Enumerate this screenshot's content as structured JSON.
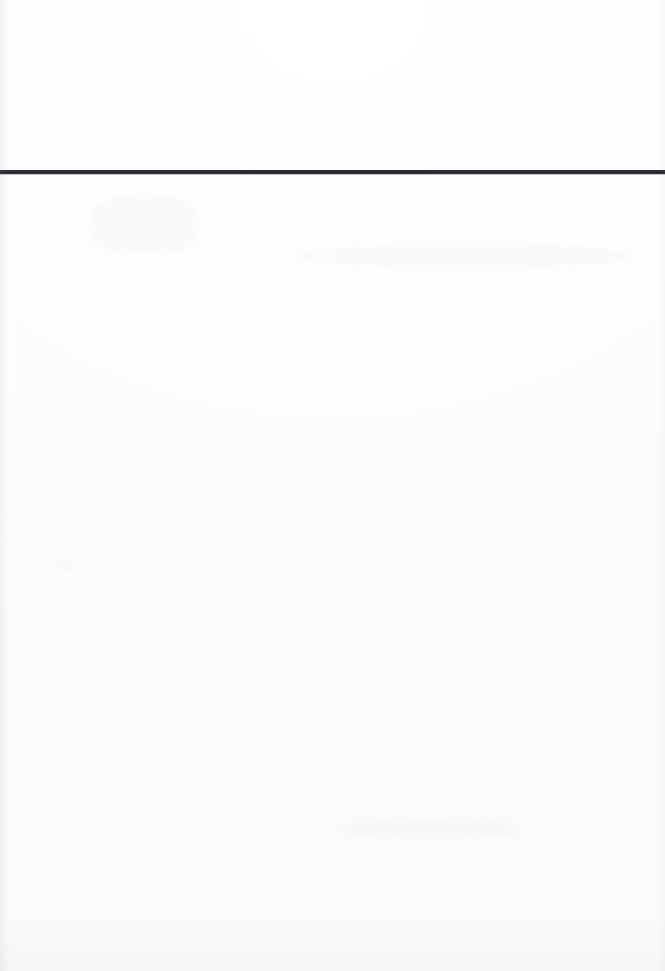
{
  "document": {
    "page_kind": "scanned-blank-page",
    "background_color": "#ffffff",
    "body_text": "",
    "page_number": ""
  },
  "header": {
    "title": "",
    "subtitle": "",
    "rule": {
      "color": "#2b2d31",
      "thickness_px": 4,
      "top_px": 170,
      "width_px": 665
    },
    "graphic": {
      "name": "network-mesh-graphic",
      "description": "abstract low-poly network of nodes connected by thin straight lines, densest toward the upper right",
      "node_color": "#b4b7bd",
      "node_color_dark": "#9a9ea6",
      "edge_color": "#d6d8dc",
      "edge_color_faint": "#e8e9ec",
      "nodes": [
        {
          "id": "n1",
          "x": 4,
          "y": 32,
          "r": 4.2,
          "shade": "dark"
        },
        {
          "id": "n2",
          "x": 74,
          "y": 78,
          "r": 3.6,
          "shade": "dark"
        },
        {
          "id": "n3",
          "x": 154,
          "y": 56,
          "r": 3.8,
          "shade": "mid"
        },
        {
          "id": "n4",
          "x": 152,
          "y": 135,
          "r": 3.2,
          "shade": "light"
        },
        {
          "id": "n5",
          "x": 237,
          "y": 112,
          "r": 3.4,
          "shade": "mid"
        },
        {
          "id": "n6",
          "x": 305,
          "y": 55,
          "r": 3.0,
          "shade": "light"
        },
        {
          "id": "n7",
          "x": 434,
          "y": 37,
          "r": 3.6,
          "shade": "mid"
        },
        {
          "id": "n8",
          "x": 441,
          "y": 64,
          "r": 3.2,
          "shade": "light"
        },
        {
          "id": "n9",
          "x": 497,
          "y": 21,
          "r": 3.4,
          "shade": "mid"
        },
        {
          "id": "n10",
          "x": 521,
          "y": 58,
          "r": 3.6,
          "shade": "mid"
        },
        {
          "id": "n11",
          "x": 531,
          "y": 75,
          "r": 3.6,
          "shade": "mid"
        },
        {
          "id": "n12",
          "x": 530,
          "y": 14,
          "r": 3.0,
          "shade": "light"
        },
        {
          "id": "n13",
          "x": 553,
          "y": 87,
          "r": 3.8,
          "shade": "dark"
        },
        {
          "id": "n14",
          "x": 584,
          "y": 90,
          "r": 3.8,
          "shade": "dark"
        },
        {
          "id": "n15",
          "x": 624,
          "y": 88,
          "r": 3.4,
          "shade": "mid"
        },
        {
          "id": "n16",
          "x": 647,
          "y": 86,
          "r": 3.4,
          "shade": "mid"
        },
        {
          "id": "n17",
          "x": 582,
          "y": 109,
          "r": 3.6,
          "shade": "mid"
        },
        {
          "id": "n18",
          "x": 607,
          "y": 134,
          "r": 3.8,
          "shade": "dark"
        },
        {
          "id": "n19",
          "x": 568,
          "y": 167,
          "r": 3.6,
          "shade": "mid"
        },
        {
          "id": "n20",
          "x": 440,
          "y": 121,
          "r": 3.0,
          "shade": "light"
        },
        {
          "id": "n21",
          "x": 445,
          "y": 59,
          "r": 2.8,
          "shade": "light"
        },
        {
          "id": "n22",
          "x": 663,
          "y": 57,
          "r": 3.0,
          "shade": "light"
        },
        {
          "id": "n23",
          "x": 355,
          "y": 27,
          "r": 2.6,
          "shade": "faint"
        },
        {
          "id": "n24",
          "x": 265,
          "y": 12,
          "r": 2.4,
          "shade": "faint"
        },
        {
          "id": "n25",
          "x": 80,
          "y": 6,
          "r": 2.6,
          "shade": "faint"
        }
      ],
      "edges": [
        [
          "n1",
          "n2"
        ],
        [
          "n1",
          "n3"
        ],
        [
          "n1",
          "n4"
        ],
        [
          "n1",
          "n25"
        ],
        [
          "n2",
          "n3"
        ],
        [
          "n2",
          "n4"
        ],
        [
          "n2",
          "n5"
        ],
        [
          "n3",
          "n4"
        ],
        [
          "n3",
          "n5"
        ],
        [
          "n3",
          "n6"
        ],
        [
          "n4",
          "n5"
        ],
        [
          "n5",
          "n6"
        ],
        [
          "n6",
          "n7"
        ],
        [
          "n6",
          "n23"
        ],
        [
          "n7",
          "n8"
        ],
        [
          "n7",
          "n9"
        ],
        [
          "n7",
          "n10"
        ],
        [
          "n7",
          "n13"
        ],
        [
          "n7",
          "n21"
        ],
        [
          "n8",
          "n9"
        ],
        [
          "n8",
          "n13"
        ],
        [
          "n8",
          "n17"
        ],
        [
          "n8",
          "n20"
        ],
        [
          "n9",
          "n10"
        ],
        [
          "n9",
          "n12"
        ],
        [
          "n9",
          "n13"
        ],
        [
          "n9",
          "n11"
        ],
        [
          "n10",
          "n11"
        ],
        [
          "n10",
          "n13"
        ],
        [
          "n10",
          "n14"
        ],
        [
          "n11",
          "n13"
        ],
        [
          "n11",
          "n14"
        ],
        [
          "n11",
          "n17"
        ],
        [
          "n12",
          "n14"
        ],
        [
          "n12",
          "n15"
        ],
        [
          "n13",
          "n14"
        ],
        [
          "n13",
          "n17"
        ],
        [
          "n13",
          "n15"
        ],
        [
          "n14",
          "n15"
        ],
        [
          "n14",
          "n16"
        ],
        [
          "n14",
          "n17"
        ],
        [
          "n14",
          "n18"
        ],
        [
          "n15",
          "n16"
        ],
        [
          "n15",
          "n18"
        ],
        [
          "n15",
          "n22"
        ],
        [
          "n16",
          "n18"
        ],
        [
          "n16",
          "n22"
        ],
        [
          "n17",
          "n18"
        ],
        [
          "n17",
          "n19"
        ],
        [
          "n18",
          "n19"
        ],
        [
          "n18",
          "n22"
        ],
        [
          "n19",
          "n13"
        ],
        [
          "n19",
          "n14"
        ],
        [
          "n19",
          "n17"
        ],
        [
          "n20",
          "n19"
        ],
        [
          "n20",
          "n13"
        ],
        [
          "n20",
          "n5"
        ],
        [
          "n21",
          "n9"
        ],
        [
          "n23",
          "n7"
        ],
        [
          "n24",
          "n23"
        ],
        [
          "n25",
          "n3"
        ]
      ]
    }
  }
}
